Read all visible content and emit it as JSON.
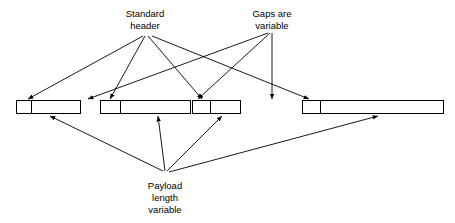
{
  "diagram": {
    "background_color": "#ffffff",
    "stroke_color": "#000000",
    "width": 455,
    "height": 223,
    "labels": [
      {
        "id": "standard-header",
        "lines": [
          "Standard",
          "header"
        ],
        "x": 145,
        "y": 14,
        "line_height": 12
      },
      {
        "id": "gaps-are-variable",
        "lines": [
          "Gaps are",
          "variable"
        ],
        "x": 272,
        "y": 14,
        "line_height": 12
      },
      {
        "id": "payload-length-variable",
        "lines": [
          "Payload",
          "length",
          "variable"
        ],
        "x": 165,
        "y": 186,
        "line_height": 12
      }
    ],
    "frames": [
      {
        "id": "frame-1",
        "x": 16,
        "y": 100,
        "width": 64,
        "height": 13,
        "header_width": 15,
        "header_label": "",
        "payload_label": ""
      },
      {
        "id": "frame-2",
        "x": 100,
        "y": 100,
        "width": 90,
        "height": 13,
        "header_width": 20,
        "header_label": "",
        "payload_label": ""
      },
      {
        "id": "frame-3",
        "x": 192,
        "y": 100,
        "width": 48,
        "height": 13,
        "header_width": 18,
        "header_label": "",
        "payload_label": ""
      },
      {
        "id": "frame-4",
        "x": 302,
        "y": 100,
        "width": 141,
        "height": 13,
        "header_width": 18,
        "header_label": "",
        "payload_label": ""
      }
    ],
    "connectors": [
      {
        "id": "header-to-frame1",
        "from": [
          143,
          36
        ],
        "to": [
          28,
          99
        ],
        "source": "standard-header",
        "target": "frame-1-header"
      },
      {
        "id": "header-to-frame2",
        "from": [
          145,
          36
        ],
        "to": [
          110,
          99
        ],
        "source": "standard-header",
        "target": "frame-2-header"
      },
      {
        "id": "header-to-frame3",
        "from": [
          148,
          36
        ],
        "to": [
          202,
          99
        ],
        "source": "standard-header",
        "target": "frame-3-header"
      },
      {
        "id": "header-to-frame4",
        "from": [
          152,
          36
        ],
        "to": [
          309,
          99
        ],
        "source": "standard-header",
        "target": "frame-4-header"
      },
      {
        "id": "gaps-to-gap1",
        "from": [
          268,
          33
        ],
        "to": [
          88,
          99
        ],
        "source": "gaps-are-variable",
        "target": "gap-before-frame-2"
      },
      {
        "id": "gaps-to-gap2",
        "from": [
          270,
          33
        ],
        "to": [
          198,
          99
        ],
        "source": "gaps-are-variable",
        "target": "gap-before-frame-3"
      },
      {
        "id": "gaps-to-gap3",
        "from": [
          272,
          33
        ],
        "to": [
          272,
          99
        ],
        "source": "gaps-are-variable",
        "target": "gap-before-frame-4"
      },
      {
        "id": "payload-to-frame1",
        "from": [
          163,
          171
        ],
        "to": [
          50,
          116
        ],
        "source": "payload-length-variable",
        "target": "frame-1-payload"
      },
      {
        "id": "payload-to-frame2",
        "from": [
          165,
          171
        ],
        "to": [
          158,
          116
        ],
        "source": "payload-length-variable",
        "target": "frame-2-payload"
      },
      {
        "id": "payload-to-frame3",
        "from": [
          167,
          171
        ],
        "to": [
          222,
          116
        ],
        "source": "payload-length-variable",
        "target": "frame-3-payload"
      },
      {
        "id": "payload-to-frame4",
        "from": [
          169,
          172
        ],
        "to": [
          378,
          116
        ],
        "source": "payload-length-variable",
        "target": "frame-4-payload"
      }
    ]
  }
}
